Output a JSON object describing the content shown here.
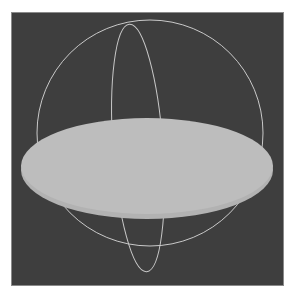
{
  "scene": {
    "description": "3D viewport rendering of an oblate ellipsoid (flattened disc) inside a wireframe bounding sphere",
    "objects": [
      {
        "name": "bounding-sphere",
        "kind": "wireframe-circle"
      },
      {
        "name": "meridian-ring",
        "kind": "wireframe-ellipse"
      },
      {
        "name": "oblate-disc",
        "kind": "solid-ellipsoid"
      }
    ]
  },
  "colors": {
    "page_background": "#ffffff",
    "viewport_background": "#3e3e3e",
    "wireframe": "#c9c9c9",
    "disc_fill": "#bdbdbd",
    "disc_rim": "#b2b2b2",
    "viewport_border": "#8a8a8a"
  }
}
